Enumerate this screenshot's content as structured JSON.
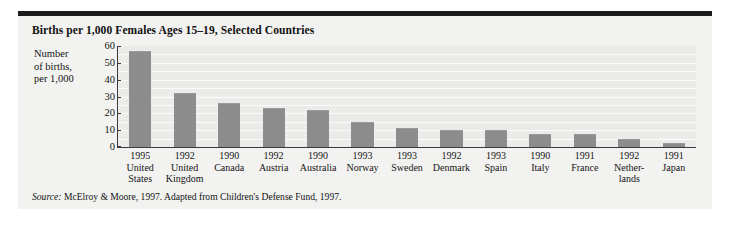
{
  "figure": {
    "title": "Births per 1,000 Females Ages 15–19, Selected Countries",
    "source_word": "Source:",
    "source_text": " McElroy & Moore, 1997. Adapted from Children's Defense Fund, 1997."
  },
  "colors": {
    "panel_background": "#f2f2f0",
    "plot_background": "#eeeeec",
    "bar_fill": "#8c8c8c",
    "axis_line": "#3a3a3a",
    "top_rule": "#1b1b1b",
    "gridline": "#fbfbfa",
    "text": "#141414"
  },
  "chart_data": {
    "type": "bar",
    "title": "Births per 1,000 Females Ages 15–19, Selected Countries",
    "xlabel": "",
    "ylabel": "Number of births, per 1,000",
    "ylabel_lines": [
      "Number",
      "of births,",
      "per 1,000"
    ],
    "ylim": [
      0,
      60
    ],
    "yticks": [
      0,
      10,
      20,
      30,
      40,
      50,
      60
    ],
    "ytick_labels": [
      "0",
      "10",
      "20",
      "30",
      "40",
      "50",
      "60"
    ],
    "grid": true,
    "grid_axis": "y",
    "grid_step": 5,
    "legend": false,
    "categories": [
      "United States",
      "United Kingdom",
      "Canada",
      "Austria",
      "Australia",
      "Norway",
      "Sweden",
      "Denmark",
      "Spain",
      "Italy",
      "France",
      "Netherlands",
      "Japan"
    ],
    "category_lines": [
      [
        "United",
        "States"
      ],
      [
        "United",
        "Kingdom"
      ],
      [
        "Canada"
      ],
      [
        "Austria"
      ],
      [
        "Australia"
      ],
      [
        "Norway"
      ],
      [
        "Sweden"
      ],
      [
        "Denmark"
      ],
      [
        "Spain"
      ],
      [
        "Italy"
      ],
      [
        "France"
      ],
      [
        "Nether-",
        "lands"
      ],
      [
        "Japan"
      ]
    ],
    "years": [
      "1995",
      "1992",
      "1990",
      "1992",
      "1990",
      "1993",
      "1993",
      "1992",
      "1993",
      "1990",
      "1991",
      "1992",
      "1991"
    ],
    "values": [
      57,
      32,
      26,
      23,
      22,
      15,
      11.5,
      10,
      10,
      7.5,
      7.5,
      5,
      2.5
    ]
  }
}
